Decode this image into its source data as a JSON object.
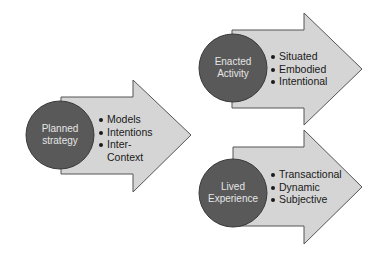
{
  "colors": {
    "arrow_fill": "#d5d5d5",
    "arrow_stroke": "#555555",
    "circle_fill": "#595959",
    "circle_text": "#e6e6e6",
    "bullet_text": "#1a1a1a"
  },
  "nodes": [
    {
      "id": "planned",
      "circle_label_line1": "Planned",
      "circle_label_line2": "strategy",
      "bullets": [
        "Models",
        "Intentions",
        "Inter-",
        "Context"
      ]
    },
    {
      "id": "enacted",
      "circle_label_line1": "Enacted",
      "circle_label_line2": "Activity",
      "bullets": [
        "Situated",
        "Embodied",
        "Intentional"
      ]
    },
    {
      "id": "lived",
      "circle_label_line1": "Lived",
      "circle_label_line2": "Experience",
      "bullets": [
        "Transactional",
        "Dynamic",
        "Subjective"
      ]
    }
  ]
}
